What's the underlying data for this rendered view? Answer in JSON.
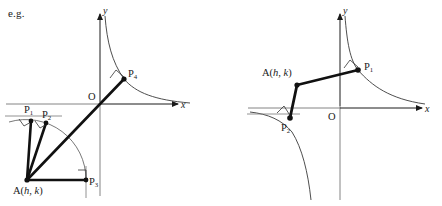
{
  "figure": {
    "caption": "e.g.",
    "colors": {
      "ink": "#1a1a1a",
      "thin_line": "#555555",
      "curve": "#3a3a3a",
      "background": "#ffffff"
    },
    "panels": [
      {
        "id": "left-panel",
        "name": "left-diagram",
        "axes": {
          "x_label": "x",
          "y_label": "y",
          "origin_label": "O",
          "origin_px": [
            100,
            104
          ]
        },
        "anchor_point": {
          "label": "A(h, k)",
          "label_text": "A(h, k)",
          "px": [
            27,
            180
          ]
        },
        "points": [
          {
            "label": "P",
            "sub": "1",
            "px": [
              31,
              121
            ],
            "label_px": [
              24,
              104
            ]
          },
          {
            "label": "P",
            "sub": "2",
            "px": [
              46,
              123
            ],
            "label_px": [
              41,
              108
            ]
          },
          {
            "label": "P",
            "sub": "3",
            "px": [
              86,
              180
            ],
            "label_px": [
              89,
              178
            ]
          },
          {
            "label": "P",
            "sub": "4",
            "px": [
              124,
              79
            ],
            "label_px": [
              127,
              70
            ]
          }
        ],
        "curve": {
          "type": "hyperbola",
          "description": "y = c/x first-quadrant branch"
        },
        "arc": {
          "description": "circular arc centred at A through P1..P3",
          "radius_px": 60
        },
        "right_angle_marks": 4
      },
      {
        "id": "right-panel",
        "name": "right-diagram",
        "axes": {
          "x_label": "x",
          "y_label": "y",
          "origin_label": "O",
          "origin_px": [
            340,
            108
          ]
        },
        "anchor_point": {
          "label": "A(h, k)",
          "label_text": "A(h, k)",
          "px": [
            297,
            85
          ]
        },
        "points": [
          {
            "label": "P",
            "sub": "1",
            "px": [
              358,
              70
            ],
            "label_px": [
              363,
              63
            ]
          },
          {
            "label": "P",
            "sub": "2",
            "px": [
              290,
              118
            ],
            "label_px": [
              283,
              123
            ]
          }
        ],
        "curve": {
          "type": "hyperbola",
          "description": "y = c/x both branches"
        },
        "right_angle_marks": 2
      }
    ]
  }
}
